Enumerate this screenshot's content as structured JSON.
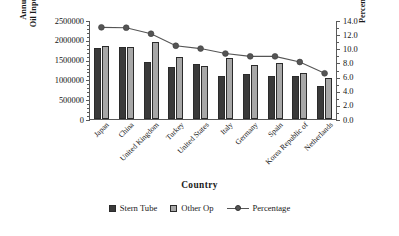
{
  "chart_data": {
    "type": "bar",
    "title": "",
    "xlabel": "Country",
    "ylabel": "Annual Lube Oil Input (Litres)",
    "ylabel_line1": "Annual Lube",
    "ylabel_line2": "Oil Input (Litres)",
    "y2label": "Percentage (%)",
    "grid": false,
    "legend_position": "bottom",
    "categories": [
      "Japan",
      "China",
      "United Kingdom",
      "Turkey",
      "United States",
      "Italy",
      "Germany",
      "Spain",
      "Korea Republic of",
      "Netherlands"
    ],
    "series": [
      {
        "name": "Stern Tube",
        "type": "bar",
        "axis": "left",
        "color": "#3a3a3a",
        "values": [
          1820000,
          1840000,
          1450000,
          1325000,
          1405000,
          1085000,
          1140000,
          1100000,
          1110000,
          840000
        ]
      },
      {
        "name": "Other Op",
        "type": "bar",
        "axis": "left",
        "color": "#a8a8a8",
        "values": [
          1860000,
          1845000,
          1965000,
          1570000,
          1350000,
          1565000,
          1390000,
          1440000,
          1175000,
          1055000
        ]
      },
      {
        "name": "Percentage",
        "type": "line",
        "axis": "right",
        "color": "#555555",
        "values": [
          13.1,
          13.05,
          12.2,
          10.5,
          10.1,
          9.4,
          9.0,
          9.0,
          8.2,
          6.6
        ]
      }
    ],
    "yaxis_left": {
      "min": 0,
      "max": 2500000,
      "step": 500000,
      "ticks": [
        "0",
        "500000",
        "1000000",
        "1500000",
        "2000000",
        "2500000"
      ]
    },
    "yaxis_right": {
      "min": 0.0,
      "max": 14.0,
      "step": 2.0,
      "ticks": [
        "0.0",
        "2.0",
        "4.0",
        "6.0",
        "8.0",
        "10.0",
        "12.0",
        "14.0"
      ]
    },
    "legend": [
      {
        "label": "Stern Tube",
        "marker": "square-dark"
      },
      {
        "label": "Other Op",
        "marker": "square-light"
      },
      {
        "label": "Percentage",
        "marker": "line-dot"
      }
    ]
  }
}
